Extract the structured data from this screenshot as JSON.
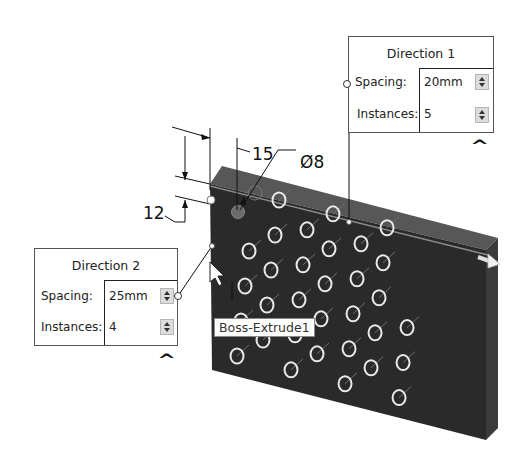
{
  "viewport": {
    "feature_name": "Boss-Extrude1",
    "model": {
      "body_color": "#2b2b2b",
      "top_face_color": "#555555",
      "side_face_color": "#3a3a3a",
      "hole_outline_color": "#e9e9e9",
      "hole_rows": 5,
      "hole_columns": 4
    },
    "dimensions": {
      "edge_offset_vertical": "12",
      "edge_offset_horizontal": "15",
      "hole_diameter": "Ø8"
    }
  },
  "direction1": {
    "title": "Direction 1",
    "spacing_label": "Spacing:",
    "spacing_value": "20mm",
    "instances_label": "Instances:",
    "instances_value": "5",
    "collapse_icon": "^"
  },
  "direction2": {
    "title": "Direction 2",
    "spacing_label": "Spacing:",
    "spacing_value": "25mm",
    "instances_label": "Instances:",
    "instances_value": "4",
    "collapse_icon": "^"
  }
}
